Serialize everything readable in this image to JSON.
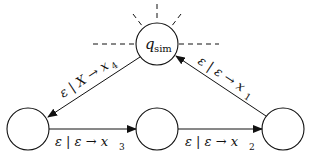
{
  "diagram": {
    "type": "state-machine",
    "states": [
      {
        "id": "q_sim",
        "label": "q",
        "subscript": "sim",
        "x": 157,
        "y": 44,
        "r": 21
      },
      {
        "id": "s_left",
        "label": "",
        "x": 28,
        "y": 129,
        "r": 21
      },
      {
        "id": "s_mid",
        "label": "",
        "x": 157,
        "y": 129,
        "r": 21
      },
      {
        "id": "s_right",
        "label": "",
        "x": 283,
        "y": 129,
        "r": 21
      }
    ],
    "transitions": [
      {
        "from": "q_sim",
        "to": "s_left",
        "label": "ε | X → x",
        "subscript": "4"
      },
      {
        "from": "s_left",
        "to": "s_mid",
        "label": "ε | ε → x",
        "subscript": "3"
      },
      {
        "from": "s_mid",
        "to": "s_right",
        "label": "ε | ε → x",
        "subscript": "2"
      },
      {
        "from": "s_right",
        "to": "q_sim",
        "label": "ε | ε → x",
        "subscript": "1"
      }
    ],
    "annotations": {
      "q_sim_dashes": "dashed rays indicating other connections"
    },
    "colors": {
      "stroke": "#111111",
      "background": "#ffffff"
    }
  }
}
